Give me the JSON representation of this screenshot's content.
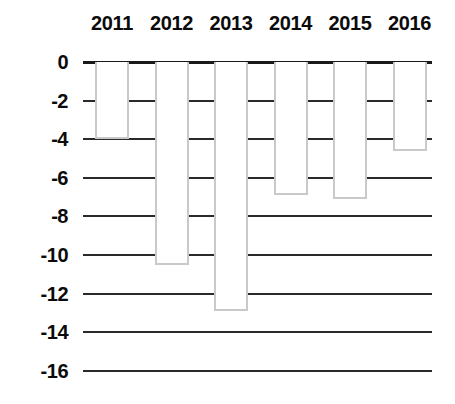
{
  "chart_data": {
    "type": "bar",
    "title": "",
    "subtitle": "",
    "xlabel": "",
    "ylabel": "",
    "categories": [
      "2011",
      "2012",
      "2013",
      "2014",
      "2015",
      "2016"
    ],
    "values": [
      -4.0,
      -10.5,
      -12.9,
      -6.9,
      -7.1,
      -4.6
    ],
    "series": [
      {
        "name": "",
        "values": [
          -4.0,
          -10.5,
          -12.9,
          -6.9,
          -7.1,
          -4.6
        ]
      }
    ],
    "ylim": [
      -16,
      0
    ],
    "ytick_labels": [
      "0",
      "-2",
      "-4",
      "-6",
      "-8",
      "-10",
      "-12",
      "-14",
      "-16"
    ],
    "ytick_values": [
      0,
      -2,
      -4,
      -6,
      -8,
      -10,
      -12,
      -14,
      -16
    ],
    "xtick_labels": [
      "2011",
      "2012",
      "2013",
      "2014",
      "2015",
      "2016"
    ],
    "grid": true,
    "grid_axis": "y",
    "legend": false,
    "legend_position": "none",
    "x_axis_position": "top",
    "colors": {
      "bar_fill": "#ffffff",
      "bar_stroke": "#c9c9c9",
      "gridline": "#2a2a2a",
      "zero_line": "#1a1a1a",
      "text": "#0b0b0b",
      "background": "#ffffff"
    }
  },
  "geometry": {
    "plot_left": 83,
    "plot_width": 349,
    "zero_y": 62,
    "px_per_unit": 19.3,
    "bar_width": 34,
    "bar_pitch": 59.5,
    "first_bar_left": 12
  }
}
